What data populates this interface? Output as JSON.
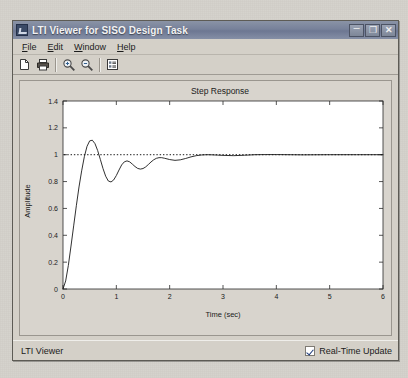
{
  "window": {
    "title": "LTI Viewer for SISO Design Task",
    "app_icon": "lti-viewer-icon",
    "controls": {
      "minimize": "–",
      "maximize": "❐",
      "close": "✕"
    }
  },
  "menubar": {
    "items": [
      {
        "label": "File",
        "mnemonic": "F",
        "rest": "ile"
      },
      {
        "label": "Edit",
        "mnemonic": "E",
        "rest": "dit"
      },
      {
        "label": "Window",
        "mnemonic": "W",
        "rest": "indow"
      },
      {
        "label": "Help",
        "mnemonic": "H",
        "rest": "elp"
      }
    ]
  },
  "toolbar": {
    "buttons": [
      {
        "name": "new-figure-button",
        "icon": "page-icon",
        "tooltip": "New"
      },
      {
        "name": "print-button",
        "icon": "printer-icon",
        "tooltip": "Print"
      },
      {
        "name": "zoom-in-button",
        "icon": "zoom-in-icon",
        "tooltip": "Zoom In"
      },
      {
        "name": "zoom-out-button",
        "icon": "zoom-out-icon",
        "tooltip": "Zoom Out"
      },
      {
        "name": "response-config-button",
        "icon": "properties-icon",
        "tooltip": "Plot Configurations"
      }
    ]
  },
  "statusbar": {
    "text": "LTI Viewer",
    "realtime_update": {
      "label": "Real-Time Update",
      "checked": true
    }
  },
  "chart_data": {
    "type": "line",
    "title": "Step Response",
    "xlabel": "Time (sec)",
    "ylabel": "Amplitude",
    "xlim": [
      0,
      6
    ],
    "ylim": [
      0,
      1.4
    ],
    "grid": false,
    "xticks": [
      "0",
      "1",
      "2",
      "3",
      "4",
      "5",
      "6"
    ],
    "xtick_values": [
      0,
      1,
      2,
      3,
      4,
      5,
      6
    ],
    "yticks": [
      "0",
      "0.2",
      "0.4",
      "0.6",
      "0.8",
      "1",
      "1.2",
      "1.4"
    ],
    "ytick_values": [
      0,
      0.2,
      0.4,
      0.6,
      0.8,
      1,
      1.2,
      1.4
    ],
    "series": [
      {
        "name": "Step Response",
        "style": "solid",
        "color": "#1a1a1a",
        "x": [
          0.0,
          0.05,
          0.1,
          0.15,
          0.2,
          0.25,
          0.3,
          0.35,
          0.4,
          0.45,
          0.5,
          0.55,
          0.6,
          0.65,
          0.7,
          0.75,
          0.8,
          0.85,
          0.9,
          0.95,
          1.0,
          1.05,
          1.1,
          1.15,
          1.2,
          1.25,
          1.3,
          1.35,
          1.4,
          1.45,
          1.5,
          1.55,
          1.6,
          1.65,
          1.7,
          1.75,
          1.8,
          1.85,
          1.9,
          1.95,
          2.0,
          2.1,
          2.2,
          2.3,
          2.4,
          2.5,
          2.6,
          2.7,
          2.8,
          2.9,
          3.0,
          3.2,
          3.4,
          3.6,
          3.8,
          4.0,
          4.5,
          5.0,
          5.5,
          6.0
        ],
        "y": [
          0.0,
          0.06,
          0.175,
          0.32,
          0.47,
          0.62,
          0.76,
          0.88,
          0.985,
          1.062,
          1.103,
          1.108,
          1.082,
          1.031,
          0.965,
          0.897,
          0.84,
          0.804,
          0.797,
          0.812,
          0.845,
          0.886,
          0.924,
          0.947,
          0.954,
          0.947,
          0.93,
          0.912,
          0.898,
          0.893,
          0.897,
          0.909,
          0.927,
          0.946,
          0.962,
          0.973,
          0.978,
          0.978,
          0.974,
          0.969,
          0.964,
          0.958,
          0.962,
          0.972,
          0.984,
          0.993,
          0.998,
          1.0,
          0.999,
          0.997,
          0.995,
          0.993,
          0.996,
          1.0,
          1.001,
          1.001,
          0.999,
          1.0,
          1.0,
          1.0
        ]
      },
      {
        "name": "Final Value Reference",
        "style": "dotted",
        "color": "#1a1a1a",
        "value": 1.0
      }
    ]
  }
}
